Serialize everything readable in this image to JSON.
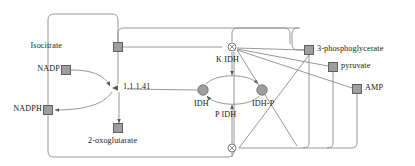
{
  "diagram": {
    "colors": {
      "line": "#8c8c8c",
      "node_fill": "#9e9e9e",
      "node_stroke": "#5a5a5a",
      "text": "#1a1a1a",
      "background": "#ffffff"
    },
    "species": [
      {
        "id": "isocitrate",
        "label": "Isocitrate",
        "shape": "square",
        "x": 118,
        "y": 47,
        "label_x": 68,
        "label_y": 43,
        "label_align": "right"
      },
      {
        "id": "nadp",
        "label": "NADP",
        "shape": "square",
        "x": 66,
        "y": 70,
        "label_x": 32,
        "label_y": 66,
        "label_align": "right"
      },
      {
        "id": "nadph",
        "label": "NADPH",
        "shape": "square",
        "x": 48,
        "y": 110,
        "label_x": 12,
        "label_y": 106,
        "label_align": "right"
      },
      {
        "id": "2-oxoglutarate",
        "label": "2-oxoglutarate",
        "shape": "square",
        "x": 118,
        "y": 128,
        "label_x": 89,
        "label_y": 138,
        "label_align": "left"
      },
      {
        "id": "idh",
        "label": "IDH",
        "shape": "circle",
        "x": 203,
        "y": 90,
        "label_x": 195,
        "label_y": 102,
        "label_align": "left"
      },
      {
        "id": "idh-p",
        "label": "IDH-P",
        "shape": "circle",
        "x": 262,
        "y": 90,
        "label_x": 253,
        "label_y": 102,
        "label_align": "left"
      },
      {
        "id": "3-phosphoglycerate",
        "label": "3-phosphoglycerate",
        "shape": "square",
        "x": 309,
        "y": 50,
        "label_x": 317,
        "label_y": 46,
        "label_align": "left"
      },
      {
        "id": "pyruvate",
        "label": "pyruvate",
        "shape": "square",
        "x": 333,
        "y": 67,
        "label_x": 341,
        "label_y": 63,
        "label_align": "left"
      },
      {
        "id": "amp",
        "label": "AMP",
        "shape": "square",
        "x": 357,
        "y": 89,
        "label_x": 365,
        "label_y": 85,
        "label_align": "left"
      }
    ],
    "reactions": [
      {
        "id": "r1-1-1-41",
        "label": "1.1.1.41",
        "type": "arrow-node",
        "x": 119,
        "y": 88,
        "label_x": 124,
        "label_y": 84
      },
      {
        "id": "k-idh",
        "label": "K IDH",
        "type": "junction",
        "x": 232,
        "y": 47,
        "label_x": 216,
        "label_y": 57
      },
      {
        "id": "p-idh",
        "label": "P IDH",
        "type": "junction",
        "x": 232,
        "y": 148,
        "label_x": 215,
        "label_y": 112
      }
    ],
    "edges": [
      "isocitrate -> 1.1.1.41",
      "NADP -> 1.1.1.41",
      "1.1.1.41 -> NADPH",
      "1.1.1.41 -> 2-oxoglutarate",
      "IDH -> IDH-P (K IDH)",
      "IDH-P -> IDH (P IDH)",
      "1.1.1.41 modulated by IDH",
      "K IDH modulated by isocitrate",
      "K IDH modulated by 3-phosphoglycerate, pyruvate, AMP",
      "P IDH modulated by 3-phosphoglycerate, pyruvate, AMP"
    ]
  }
}
